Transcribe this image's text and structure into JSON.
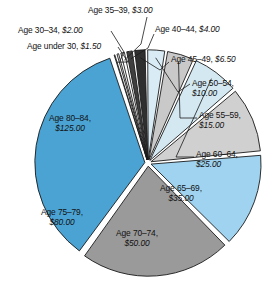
{
  "chart_data": {
    "type": "pie",
    "title": "",
    "subtitle": "",
    "xlabel": "",
    "ylabel": "",
    "legend_position": "none",
    "grid": false,
    "value_prefix": "$",
    "total": 357.0,
    "categories": [
      "Age under 30",
      "Age 30–34",
      "Age 35–39",
      "Age 40–44",
      "Age 45–49",
      "Age 50–54",
      "Age 55–59",
      "Age 60–64",
      "Age 65–69",
      "Age 70–74",
      "Age 75–79",
      "Age 80–84"
    ],
    "values": [
      1.5,
      2.0,
      3.0,
      4.0,
      6.5,
      10.0,
      15.0,
      25.0,
      35.0,
      50.0,
      80.0,
      125.0
    ],
    "value_labels": [
      "$1.50",
      "$2.00",
      "$3.00",
      "$4.00",
      "$6.50",
      "$10.00",
      "$15.00",
      "$25.00",
      "$35.00",
      "$50.00",
      "$80.00",
      "$125.00"
    ],
    "colors": [
      "#ffffff",
      "#ffffff",
      "#ffffff",
      "#3f3f3f",
      "#2f2f2f",
      "#d9ecf5",
      "#c9c9c9",
      "#d4e8f2",
      "#d0d0d0",
      "#9fd3ef",
      "#9a9a9a",
      "#4ba3d3"
    ],
    "slices": [
      {
        "label": "Age under 30",
        "value": 1.5,
        "value_label": "$1.50",
        "color": "#ffffff",
        "label_placement": "external-leader"
      },
      {
        "label": "Age 30–34",
        "value": 2.0,
        "value_label": "$2.00",
        "color": "#ffffff",
        "label_placement": "external-leader"
      },
      {
        "label": "Age 35–39",
        "value": 3.0,
        "value_label": "$3.00",
        "color": "#ffffff",
        "label_placement": "external-leader"
      },
      {
        "label": "Age 40–44",
        "value": 4.0,
        "value_label": "$4.00",
        "color": "#3f3f3f",
        "label_placement": "external-leader"
      },
      {
        "label": "Age 45–49",
        "value": 6.5,
        "value_label": "$6.50",
        "color": "#2f2f2f",
        "label_placement": "external-leader"
      },
      {
        "label": "Age 50–54",
        "value": 10.0,
        "value_label": "$10.00",
        "color": "#d9ecf5",
        "label_placement": "external-leader"
      },
      {
        "label": "Age 55–59",
        "value": 15.0,
        "value_label": "$15.00",
        "color": "#c9c9c9",
        "label_placement": "external-leader"
      },
      {
        "label": "Age 60–64",
        "value": 25.0,
        "value_label": "$25.00",
        "color": "#d4e8f2",
        "label_placement": "external-leader"
      },
      {
        "label": "Age 65–69",
        "value": 35.0,
        "value_label": "$35.00",
        "color": "#d0d0d0",
        "label_placement": "inside"
      },
      {
        "label": "Age 70–74",
        "value": 50.0,
        "value_label": "$50.00",
        "color": "#9fd3ef",
        "label_placement": "inside"
      },
      {
        "label": "Age 75–79",
        "value": 80.0,
        "value_label": "$80.00",
        "color": "#9a9a9a",
        "label_placement": "inside"
      },
      {
        "label": "Age 80–84",
        "value": 125.0,
        "value_label": "$125.00",
        "color": "#4ba3d3",
        "label_placement": "inside"
      }
    ]
  },
  "labels": {
    "l_under30": {
      "name": "Age under 30,",
      "amount": "$1.50"
    },
    "l_30_34": {
      "name": "Age 30–34,",
      "amount": "$2.00"
    },
    "l_35_39": {
      "name": "Age 35–39,",
      "amount": "$3.00"
    },
    "l_40_44": {
      "name": "Age 40–44,",
      "amount": "$4.00"
    },
    "l_45_49": {
      "name": "Age 45–49,",
      "amount": "$6.50"
    },
    "l_50_54_a": {
      "name": "Age 50–54,",
      "amount": "$10.00"
    },
    "l_55_59_a": {
      "name": "Age 55–59,",
      "amount": "$15.00"
    },
    "l_60_64_a": {
      "name": "Age 60–64,",
      "amount": "$25.00"
    },
    "l_65_69_a": {
      "name": "Age 65–69,",
      "amount": "$35.00"
    },
    "l_70_74_a": {
      "name": "Age 70–74,",
      "amount": "$50.00"
    },
    "l_75_79_a": {
      "name": "Age 75–79,",
      "amount": "$80.00"
    },
    "l_80_84_a": {
      "name": "Age 80–84,",
      "amount": "$125.00"
    }
  },
  "style": {
    "slice_outline": "#1a1a1a",
    "background": "#ffffff",
    "leader_line": "#1a1a1a"
  }
}
